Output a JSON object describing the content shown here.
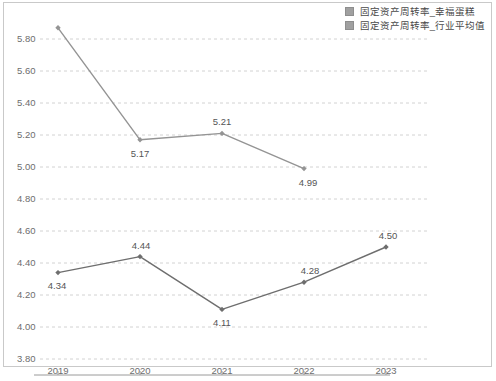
{
  "legend": {
    "position": "top-right",
    "items": [
      {
        "label": "固定资产周转率_幸福蛋糕",
        "color": "#a0a0a0",
        "marker": "legend-swatch-icon"
      },
      {
        "label": "固定资产周转率_行业平均值",
        "color": "#a0a0a0",
        "marker": "legend-swatch-icon"
      }
    ]
  },
  "chart_data": {
    "type": "line",
    "title": "",
    "xlabel": "",
    "ylabel": "",
    "x": [
      "2019",
      "2020",
      "2021",
      "2022",
      "2023"
    ],
    "categories": [
      "2019",
      "2020",
      "2021",
      "2022",
      "2023"
    ],
    "ylim": [
      3.8,
      5.9
    ],
    "yticks": [
      "3.80",
      "4.00",
      "4.20",
      "4.40",
      "4.60",
      "4.80",
      "5.00",
      "5.20",
      "5.40",
      "5.60",
      "5.80"
    ],
    "ytick_values": [
      3.8,
      4.0,
      4.2,
      4.4,
      4.6,
      4.8,
      5.0,
      5.2,
      5.4,
      5.6,
      5.8
    ],
    "grid": true,
    "grid_style": "dashed",
    "legend_position": "top-right",
    "series": [
      {
        "name": "固定资产周转率_幸福蛋糕",
        "color": "#949494",
        "values": [
          5.87,
          5.17,
          5.21,
          4.99,
          null
        ],
        "labels": [
          "",
          "5.17",
          "5.21",
          "4.99",
          ""
        ]
      },
      {
        "name": "固定资产周转率_行业平均值",
        "color": "#6e6e6e",
        "values": [
          4.34,
          4.44,
          4.11,
          4.28,
          4.5
        ],
        "labels": [
          "4.34",
          "4.44",
          "4.11",
          "4.28",
          "4.50"
        ]
      }
    ]
  }
}
